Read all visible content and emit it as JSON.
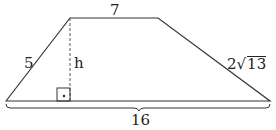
{
  "diagram": {
    "type": "trapezoid",
    "labels": {
      "top": "7",
      "left": "5",
      "height": "h",
      "right_coeff": "2",
      "right_radical_sign": "√",
      "right_radicand": "13",
      "bottom": "16"
    },
    "right_angle_marker": "•",
    "colors": {
      "stroke": "#333333",
      "text": "#222222",
      "background": "#ffffff"
    }
  }
}
